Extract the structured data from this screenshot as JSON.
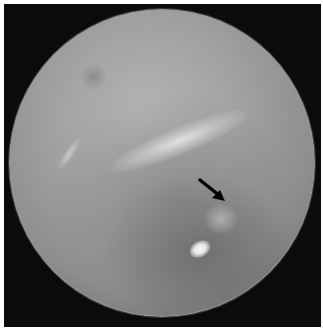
{
  "image": {
    "description": "Otoscopic view of a tympanic membrane in a circular field of view on black background",
    "annotations": [
      {
        "type": "arrow",
        "direction": "down-right",
        "color": "#000000"
      }
    ]
  },
  "colors": {
    "background": "#0b0b0b",
    "membrane": "#a2a2a2",
    "border": "#ffffff"
  }
}
